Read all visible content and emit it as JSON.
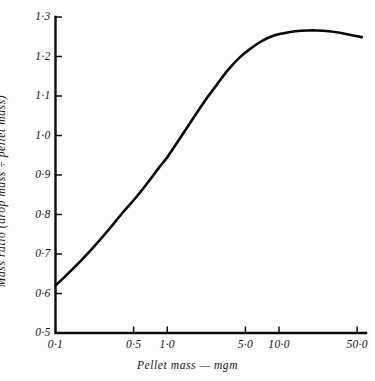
{
  "chart_data": {
    "type": "line",
    "title": "",
    "subtitle": "",
    "xlabel": "Pellet mass — mgm",
    "ylabel": "Mass ratio (drop mass ÷ pellet mass)",
    "xscale": "log",
    "yscale": "linear",
    "xlim": [
      0.1,
      60.0
    ],
    "ylim": [
      0.5,
      1.3
    ],
    "grid": false,
    "legend": "none",
    "xticks": [
      {
        "value": 0.1,
        "label": "0·0"
      },
      {
        "value": 0.5,
        "label": "0·5"
      },
      {
        "value": 1.0,
        "label": "1·0"
      },
      {
        "value": 5.0,
        "label": "5·0"
      },
      {
        "value": 10.0,
        "label": "10·0"
      },
      {
        "value": 50.0,
        "label": "50·0"
      }
    ],
    "xtick_labels_override": [
      "0·1",
      "0·5",
      "1·0",
      "5·0",
      "10·0",
      "50·0"
    ],
    "yticks": [
      {
        "value": 0.5,
        "label": "0·5"
      },
      {
        "value": 0.6,
        "label": "0·6"
      },
      {
        "value": 0.7,
        "label": "0·7"
      },
      {
        "value": 0.8,
        "label": "0·8"
      },
      {
        "value": 0.9,
        "label": "0·9"
      },
      {
        "value": 1.0,
        "label": "1·0"
      },
      {
        "value": 1.1,
        "label": "1·1"
      },
      {
        "value": 1.2,
        "label": "1·2"
      },
      {
        "value": 1.3,
        "label": "1·3"
      }
    ],
    "series": [
      {
        "name": "mass ratio",
        "color": "#0a0a0a",
        "x": [
          0.1,
          0.13,
          0.17,
          0.22,
          0.3,
          0.4,
          0.5,
          0.65,
          0.85,
          1.0,
          1.3,
          1.7,
          2.2,
          2.8,
          3.5,
          4.5,
          5.5,
          7.0,
          9.0,
          11.0,
          14.0,
          18.0,
          22.0,
          28.0,
          35.0,
          45.0,
          55.0
        ],
        "y": [
          0.62,
          0.651,
          0.684,
          0.718,
          0.762,
          0.805,
          0.836,
          0.876,
          0.92,
          0.945,
          0.993,
          1.043,
          1.09,
          1.13,
          1.166,
          1.199,
          1.219,
          1.239,
          1.253,
          1.259,
          1.264,
          1.266,
          1.266,
          1.264,
          1.26,
          1.254,
          1.249
        ]
      }
    ],
    "annotations": []
  },
  "axes": {
    "x_title": "Pellet mass — mgm",
    "y_title": "Mass ratio (drop mass ÷ pellet mass)"
  }
}
